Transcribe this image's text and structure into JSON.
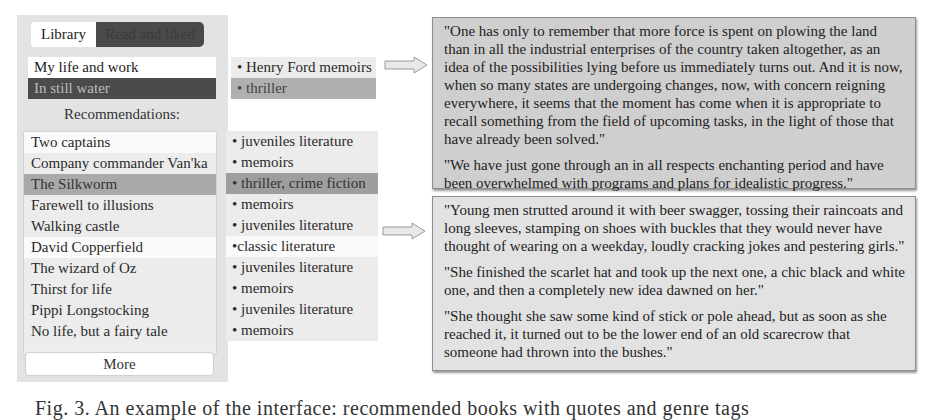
{
  "tabs": {
    "library": "Library",
    "read_and_liked": "Read and liked"
  },
  "liked_books": [
    {
      "title": "My life and work",
      "tag": "• Henry Ford memoirs",
      "selected": false
    },
    {
      "title": "In still water",
      "tag": "• thriller",
      "selected": true
    }
  ],
  "recommendations": {
    "title": "Recommendations:",
    "items": [
      {
        "title": "Two captains",
        "tag": "• juveniles literature"
      },
      {
        "title": "Company commander Van'ka",
        "tag": "• memoirs"
      },
      {
        "title": "The Silkworm",
        "tag": "• thriller, crime fiction",
        "selected": true
      },
      {
        "title": "Farewell to illusions",
        "tag": "• memoirs"
      },
      {
        "title": "Walking castle",
        "tag": "• juveniles literature"
      },
      {
        "title": "David Copperfield",
        "tag": "•classic literature"
      },
      {
        "title": "The wizard of Oz",
        "tag": "• juveniles literature"
      },
      {
        "title": "Thirst for life",
        "tag": "• memoirs"
      },
      {
        "title": "Pippi Longstocking",
        "tag": "• juveniles literature"
      },
      {
        "title": "No life, but a fairy tale",
        "tag": "• memoirs"
      }
    ],
    "more_label": "More"
  },
  "quotes": {
    "box1": [
      "\"One has only to remember that more force is spent on plowing the land than in all the industrial enterprises of the country taken altogether, as an idea of the possibilities lying before us immediately turns out. And it is now, when so many states are undergoing changes, now, with concern reigning everywhere, it seems that the moment has come when it is appropriate to recall something from the field of upcoming tasks, in the light of those that have already been solved.\"",
      "\"We have just gone through an in all respects enchanting period and have been overwhelmed with programs and plans for idealistic progress.\""
    ],
    "box2": [
      "\"Young men strutted around it with beer swagger, tossing their raincoats and long sleeves, stamping on shoes with buckles that they would never have thought of wearing on a weekday, loudly cracking jokes and pestering girls.\"",
      "\"She finished the scarlet hat and took up the next one, a chic black and white one, and then a completely new idea dawned on her.\"",
      "\"She thought she saw some kind of stick or pole ahead, but as soon as she reached it, it turned out to be the lower end of an old scarecrow that someone had thrown into the bushes.\""
    ]
  },
  "caption": "Fig. 3. An example of the interface: recommended books with quotes and genre tags",
  "icons": {
    "arrow1": "right-arrow-icon",
    "arrow2": "right-arrow-icon"
  },
  "colors": {
    "panel_bg": "#e3e3e3",
    "selected_dark": "#4b4b4b",
    "selected_row": "#a9a9a9",
    "quote_bg": "#d4d4d4"
  }
}
